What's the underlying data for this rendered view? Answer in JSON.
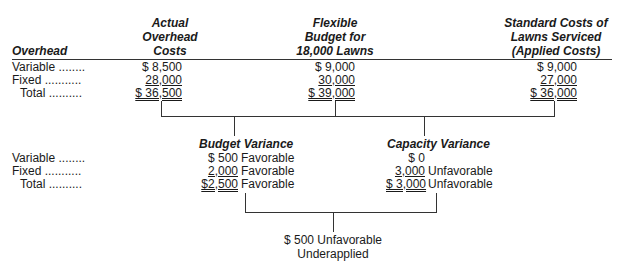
{
  "columns": {
    "label_header": "Overhead",
    "actual": [
      "Actual",
      "Overhead",
      "Costs"
    ],
    "flexible": [
      "Flexible",
      "Budget for",
      "18,000 Lawns"
    ],
    "standard": [
      "Standard Costs of",
      "Lawns Serviced",
      "(Applied Costs)"
    ]
  },
  "rows": [
    {
      "label": "Variable ........",
      "actual": "$  8,500",
      "flexible": "$  9,000",
      "standard": "$  9,000"
    },
    {
      "label": "Fixed ...........",
      "actual": "28,000",
      "flexible": "30,000",
      "standard": "27,000"
    },
    {
      "label": "Total ..........",
      "actual": "$ 36,500",
      "flexible": "$ 39,000",
      "standard": "$ 36,000"
    }
  ],
  "variances": {
    "budget_title": "Budget Variance",
    "capacity_title": "Capacity Variance",
    "rows": [
      {
        "label": "Variable ........",
        "budget_amount": "$   500",
        "budget_note": "Favorable",
        "capacity_amount": "$      0",
        "capacity_note": ""
      },
      {
        "label": "Fixed ...........",
        "budget_amount": "2,000",
        "budget_note": "Favorable",
        "capacity_amount": "3,000",
        "capacity_note": "Unfavorable"
      },
      {
        "label": "Total ..........",
        "budget_amount": "$2,500",
        "budget_note": "Favorable",
        "capacity_amount": "$ 3,000",
        "capacity_note": "Unfavorable"
      }
    ]
  },
  "result": {
    "line1": "$ 500 Unfavorable",
    "line2": "Underapplied"
  }
}
